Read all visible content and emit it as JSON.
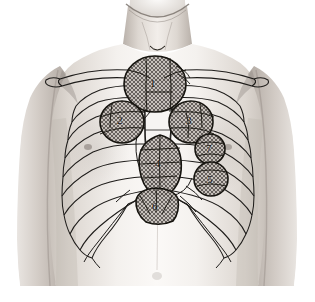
{
  "figure": {
    "background_color": "#ffffff",
    "skin_tone": "#dcd6d0",
    "outline_color": "#1a1a1a",
    "hatch_color": "#4a4a4a",
    "region_fill": "#b9b3ad"
  },
  "anatomy": {
    "parts": [
      {
        "name": "neck",
        "label": "neck"
      },
      {
        "name": "clavicle-left",
        "label": "left clavicle"
      },
      {
        "name": "clavicle-right",
        "label": "right clavicle"
      },
      {
        "name": "sternum",
        "label": "sternum"
      },
      {
        "name": "rib-cage-left",
        "label": "left rib cage"
      },
      {
        "name": "rib-cage-right",
        "label": "right rib cage"
      },
      {
        "name": "costal-margin",
        "label": "costal margin"
      },
      {
        "name": "shoulder-left",
        "label": "left shoulder"
      },
      {
        "name": "shoulder-right",
        "label": "right shoulder"
      },
      {
        "name": "arm-left",
        "label": "left arm"
      },
      {
        "name": "arm-right",
        "label": "right arm"
      },
      {
        "name": "abdomen",
        "label": "upper abdomen"
      }
    ],
    "rib_pairs_drawn": 10
  },
  "markers": [
    {
      "id": "1",
      "label": "1",
      "shape": "circle",
      "cx": 155,
      "cy": 84,
      "rx": 31,
      "ry": 28,
      "hatch": "cross",
      "label_x": 150,
      "label_y": 88
    },
    {
      "id": "2",
      "label": "2",
      "shape": "circle",
      "cx": 122,
      "cy": 122,
      "rx": 22,
      "ry": 21,
      "hatch": "cross",
      "label_x": 117,
      "label_y": 120
    },
    {
      "id": "3",
      "label": "3",
      "shape": "circle",
      "cx": 191,
      "cy": 122,
      "rx": 22,
      "ry": 21,
      "hatch": "cross",
      "label_x": 186,
      "label_y": 120
    },
    {
      "id": "4",
      "label": "4",
      "shape": "oval",
      "cx": 160,
      "cy": 164,
      "rx": 22,
      "ry": 29,
      "hatch": "cross",
      "label_x": 155,
      "label_y": 164
    },
    {
      "id": "5",
      "label": "5",
      "shape": "circle",
      "cx": 211,
      "cy": 179,
      "rx": 17,
      "ry": 17,
      "hatch": "cross",
      "label_x": 207,
      "label_y": 180
    },
    {
      "id": "6",
      "label": "6",
      "shape": "rounded",
      "cx": 156,
      "cy": 206,
      "rx": 22,
      "ry": 18,
      "hatch": "cross",
      "label_x": 152,
      "label_y": 208
    },
    {
      "id": "7",
      "label": "7",
      "shape": "circle",
      "cx": 210,
      "cy": 149,
      "rx": 15,
      "ry": 15,
      "hatch": "cross",
      "label_x": 206,
      "label_y": 150
    }
  ]
}
